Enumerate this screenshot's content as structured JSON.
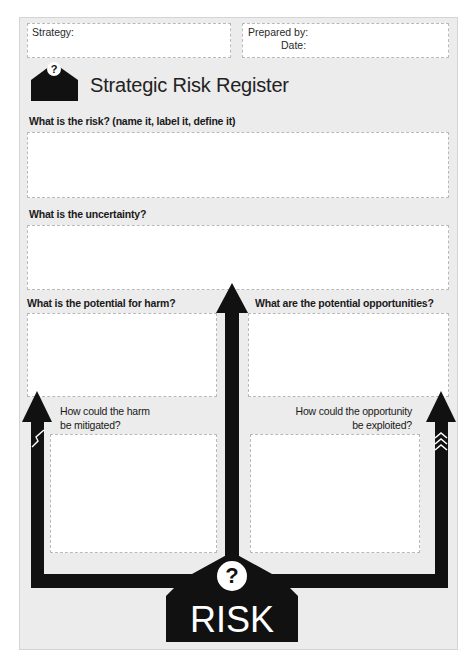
{
  "header": {
    "strategy_label": "Strategy:",
    "prepared_by_label": "Prepared by:",
    "date_label": "Date:"
  },
  "title": "Strategic Risk Register",
  "logo": {
    "icon": "question-house-icon",
    "glyph": "?"
  },
  "sections": {
    "risk": {
      "label": "What is the risk? (name it, label it, define it)",
      "value": ""
    },
    "uncertainty": {
      "label": "What is the uncertainty?",
      "value": ""
    },
    "harm": {
      "label": "What is the potential for harm?",
      "value": ""
    },
    "opportunities": {
      "label": "What are the potential opportunities?",
      "value": ""
    },
    "mitigate": {
      "label_line1": "How could the harm",
      "label_line2": "be mitigated?",
      "value": ""
    },
    "exploit": {
      "label_line1": "How could the opportunity",
      "label_line2": "be exploited?",
      "value": ""
    }
  },
  "badge": {
    "glyph": "?",
    "text": "RISK"
  },
  "colors": {
    "page_bg": "#ececec",
    "box_bg": "#ffffff",
    "box_border": "#b9b9b9",
    "arrow": "#111111"
  }
}
